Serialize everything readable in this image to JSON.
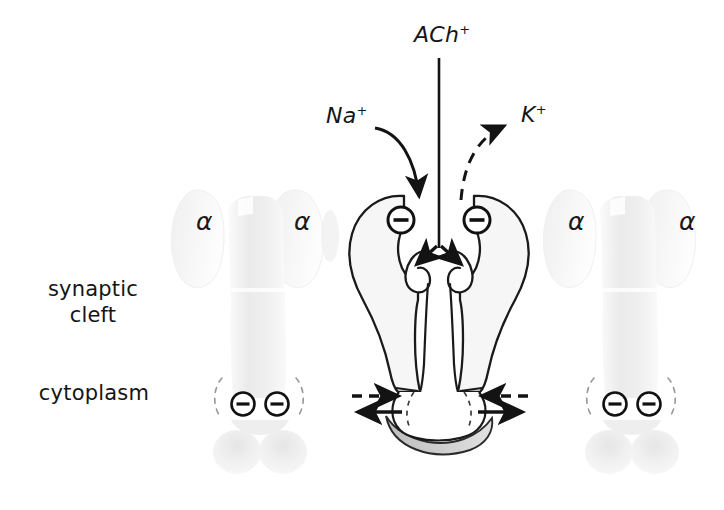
{
  "figure": {
    "background_color": "#ffffff",
    "ink_color": "#151515"
  },
  "region_labels": {
    "synaptic_cleft": "synaptic\ncleft",
    "synaptic_cleft_line1": "synaptic",
    "synaptic_cleft_line2": "cleft",
    "cytoplasm": "cytoplasm"
  },
  "ion_labels": {
    "acetylcholine": {
      "base": "ACh",
      "charge": "+",
      "full": "ACh⁺"
    },
    "sodium": {
      "base": "Na",
      "charge": "+",
      "full": "Na⁺"
    },
    "potassium": {
      "base": "K",
      "charge": "+",
      "full": "K⁺"
    }
  },
  "subunit_labels": {
    "alpha_symbol": "α",
    "instances": [
      {
        "id": "alpha-left-outer",
        "label": "α"
      },
      {
        "id": "alpha-left-inner",
        "label": "α"
      },
      {
        "id": "alpha-right-inner",
        "label": "α"
      },
      {
        "id": "alpha-right-outer",
        "label": "α"
      }
    ]
  },
  "charges": {
    "negative_symbol": "⊖",
    "central_receptor_count": 2,
    "left_ghost_count": 2,
    "right_ghost_count": 2
  },
  "arrows": {
    "ach_influx": {
      "style": "solid",
      "direction": "down",
      "ion": "ACh⁺"
    },
    "na_influx": {
      "style": "solid",
      "direction": "curve-down",
      "ion": "Na⁺"
    },
    "k_efflux": {
      "style": "dashed",
      "direction": "curve-up",
      "ion": "K⁺"
    },
    "pore_split_left": {
      "style": "solid",
      "direction": "down-left"
    },
    "pore_split_right": {
      "style": "solid",
      "direction": "down-right"
    },
    "cyto_left_in": {
      "style": "dashed",
      "direction": "right"
    },
    "cyto_left_out": {
      "style": "solid",
      "direction": "left"
    },
    "cyto_right_in": {
      "style": "dashed",
      "direction": "left"
    },
    "cyto_right_out": {
      "style": "solid",
      "direction": "right"
    }
  },
  "colors": {
    "outline": "#1a1a1a",
    "receptor_fill": "#f4f4f4",
    "ghost_fill": "#f2f2f2",
    "crescent_fill": "#c9c9c9",
    "dashed_stroke": "#6f6f6f"
  }
}
